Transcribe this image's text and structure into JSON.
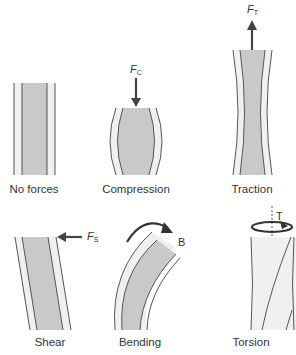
{
  "figure": {
    "panels": [
      {
        "id": "no-forces",
        "label": "No forces",
        "force": null
      },
      {
        "id": "compression",
        "label": "Compression",
        "force": {
          "symbol": "F",
          "subscript": "C",
          "direction": "down"
        }
      },
      {
        "id": "traction",
        "label": "Traction",
        "force": {
          "symbol": "F",
          "subscript": "T",
          "direction": "up"
        }
      },
      {
        "id": "shear",
        "label": "Shear",
        "force": {
          "symbol": "F",
          "subscript": "S",
          "direction": "left"
        }
      },
      {
        "id": "bending",
        "label": "Bending",
        "force": {
          "symbol": "B",
          "subscript": "",
          "direction": "clockwise-arc"
        }
      },
      {
        "id": "torsion",
        "label": "Torsion",
        "force": {
          "symbol": "T",
          "subscript": "",
          "direction": "rotation"
        }
      }
    ],
    "colors": {
      "core_fill": "#c9c9c9",
      "outer_fill": "#eeeeee",
      "line": "#555555",
      "arrow": "#444444"
    }
  }
}
